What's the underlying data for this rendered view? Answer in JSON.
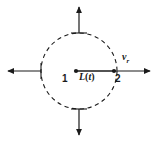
{
  "figure": {
    "background_color": "#ffffff",
    "stroke_color": "#1a1a1a",
    "width": 158,
    "height": 141
  },
  "control_volume": {
    "shape": "circle",
    "style": "dashed",
    "center_x": 79,
    "center_y": 71,
    "radius": 38
  },
  "nodes": {
    "center_label": "1",
    "boundary_label": "2",
    "center_point": {
      "x": 76,
      "y": 71
    },
    "boundary_point": {
      "x": 114,
      "y": 71
    }
  },
  "labels": {
    "length_symbol": "L",
    "length_argument_open": "(",
    "length_argument": "t",
    "length_argument_close": ")",
    "velocity_symbol": "v",
    "velocity_subscript": "r"
  },
  "arrows": [
    {
      "name": "arrow-up",
      "direction": "up",
      "from_x": 79,
      "from_y": 33,
      "to_x": 79,
      "to_y": 5
    },
    {
      "name": "arrow-down",
      "direction": "down",
      "from_x": 79,
      "from_y": 109,
      "to_x": 79,
      "to_y": 137
    },
    {
      "name": "arrow-left",
      "direction": "left",
      "from_x": 41,
      "from_y": 71,
      "to_x": 6,
      "to_y": 71
    },
    {
      "name": "arrow-right",
      "direction": "right",
      "from_x": 114,
      "from_y": 71,
      "to_x": 152,
      "to_y": 71
    }
  ]
}
